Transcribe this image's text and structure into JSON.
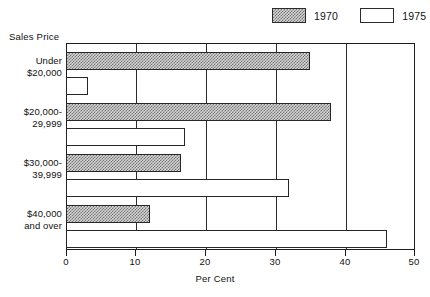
{
  "chart_data": {
    "type": "bar",
    "orientation": "horizontal",
    "title": "",
    "xlabel": "Per Cent",
    "ylabel": "Sales Price",
    "xlim": [
      0,
      50
    ],
    "xticks": [
      0,
      10,
      20,
      30,
      40,
      50
    ],
    "grid": true,
    "legend_position": "top-right",
    "categories": [
      "Under\n$20,000",
      "$20,000-\n29,999",
      "$30,000-\n39,999",
      "$40,000\nand over"
    ],
    "category_lines": [
      [
        "Under",
        "$20,000"
      ],
      [
        "$20,000-",
        "29,999"
      ],
      [
        "$30,000-",
        "39,999"
      ],
      [
        "$40,000",
        "and over"
      ]
    ],
    "series": [
      {
        "name": "1970",
        "values": [
          35,
          38,
          16.5,
          12
        ],
        "fill": "hatched-gray",
        "color": "#d7d7d7"
      },
      {
        "name": "1975",
        "values": [
          3.2,
          17,
          32,
          46
        ],
        "fill": "white",
        "color": "#ffffff"
      }
    ]
  },
  "legend": {
    "items": [
      {
        "label": "1970",
        "swatch": "hatched-swatch"
      },
      {
        "label": "1975",
        "swatch": "white-swatch"
      }
    ]
  },
  "axes": {
    "y_title": "Sales Price",
    "x_title": "Per Cent",
    "x_tick_labels": [
      "0",
      "10",
      "20",
      "30",
      "40",
      "50"
    ]
  }
}
